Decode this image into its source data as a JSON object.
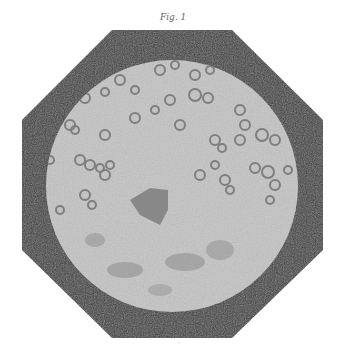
{
  "figure": {
    "caption": "Fig. 1",
    "colors": {
      "background": "#ffffff",
      "mount": "#3d3d3d",
      "field": "#c4c4c4",
      "cells": "#8a8a8a",
      "mass": "#7a7a7a"
    }
  },
  "footer": {
    "mark": "'"
  }
}
